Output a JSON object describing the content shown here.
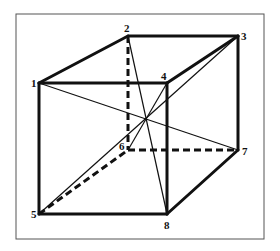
{
  "figure": {
    "type": "cube-diagram",
    "frame": {
      "x": 16,
      "y": 14,
      "width": 248,
      "height": 225,
      "color": "#555555"
    },
    "vertices": [
      {
        "id": "1",
        "x": 39,
        "y": 83,
        "label_x": 31,
        "label_y": 87
      },
      {
        "id": "2",
        "x": 128,
        "y": 36,
        "label_x": 124,
        "label_y": 32
      },
      {
        "id": "3",
        "x": 238,
        "y": 36,
        "label_x": 241,
        "label_y": 40
      },
      {
        "id": "4",
        "x": 167,
        "y": 83,
        "label_x": 161,
        "label_y": 80
      },
      {
        "id": "5",
        "x": 39,
        "y": 214,
        "label_x": 31,
        "label_y": 218
      },
      {
        "id": "6",
        "x": 128,
        "y": 150,
        "label_x": 119,
        "label_y": 150
      },
      {
        "id": "7",
        "x": 238,
        "y": 150,
        "label_x": 242,
        "label_y": 155
      },
      {
        "id": "8",
        "x": 167,
        "y": 214,
        "label_x": 164,
        "label_y": 229
      }
    ],
    "solid_edges": [
      [
        "1",
        "2"
      ],
      [
        "2",
        "3"
      ],
      [
        "1",
        "4"
      ],
      [
        "3",
        "4"
      ],
      [
        "1",
        "5"
      ],
      [
        "4",
        "8"
      ],
      [
        "3",
        "7"
      ],
      [
        "5",
        "8"
      ],
      [
        "7",
        "8"
      ]
    ],
    "hidden_edges": [
      [
        "2",
        "6"
      ],
      [
        "5",
        "6"
      ],
      [
        "6",
        "7"
      ]
    ],
    "diagonals": [
      [
        "1",
        "7"
      ],
      [
        "2",
        "8"
      ],
      [
        "3",
        "5"
      ],
      [
        "4",
        "6"
      ]
    ],
    "labels": [
      "1",
      "2",
      "3",
      "4",
      "5",
      "6",
      "7",
      "8"
    ]
  }
}
